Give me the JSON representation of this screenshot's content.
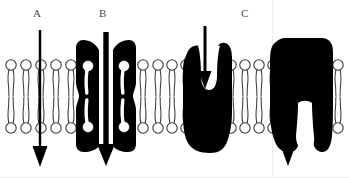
{
  "figure": {
    "background_color": "#ffffff",
    "ink_color": "#000000",
    "label_color": "#4a4a4a",
    "lipid_outline_color": "#3a3a3a",
    "width": 349,
    "height": 178
  },
  "labels": {
    "a": "A",
    "b": "B",
    "c": "C"
  },
  "membrane": {
    "name": "phospholipid-bilayer",
    "upper_head_row_y": 65,
    "lower_head_row_y": 128,
    "head_radius": 5.2,
    "midline_y": 96,
    "lipid_count_visible": 36,
    "segments": [
      {
        "name": "left-segment",
        "x_start": 4,
        "x_end": 88,
        "count": 6
      },
      {
        "name": "center-segment",
        "x_start": 116,
        "x_end": 184,
        "count": 5
      },
      {
        "name": "right-of-carrier-segment",
        "x_start": 228,
        "x_end": 266,
        "count": 3
      },
      {
        "name": "far-right-segment",
        "x_start": 316,
        "x_end": 344,
        "count": 2
      }
    ]
  },
  "elements": [
    {
      "name": "simple-diffusion-arrow",
      "label": "A",
      "kind": "arrow",
      "direction": "downward",
      "x": 40,
      "y_start": 30,
      "y_end": 166,
      "shaft_width": 2,
      "description": "thin straight arrow passing directly through the bilayer"
    },
    {
      "name": "channel-protein",
      "label": "B",
      "kind": "protein",
      "x_center": 106,
      "description": "hourglass channel protein spanning the bilayer"
    },
    {
      "name": "channel-protein-arrow",
      "label": "B",
      "kind": "arrow",
      "direction": "downward",
      "x": 106,
      "y_start": 32,
      "y_end": 164,
      "shaft_width": 5,
      "description": "thick arrow passing through the channel pore"
    },
    {
      "name": "carrier-protein-funnel",
      "kind": "protein",
      "x_center": 204,
      "description": "carrier protein with funnel-shaped binding pocket open to the exterior"
    },
    {
      "name": "carrier-protein-funnel-arrow",
      "kind": "arrow",
      "direction": "downward",
      "x": 204,
      "y_start": 26,
      "y_end": 87,
      "shaft_width": 3,
      "description": "arrow entering the open funnel of the carrier protein"
    },
    {
      "name": "carrier-protein-release",
      "label": "C",
      "kind": "protein",
      "x_center": 288,
      "description": "carrier protein open to the interior releasing its solute"
    },
    {
      "name": "carrier-protein-release-arrow",
      "label": "C",
      "kind": "arrow",
      "direction": "downward",
      "x": 288,
      "y_start": 100,
      "y_end": 165,
      "shaft_width": 3,
      "description": "arrow exiting the carrier protein into the cell interior"
    }
  ]
}
